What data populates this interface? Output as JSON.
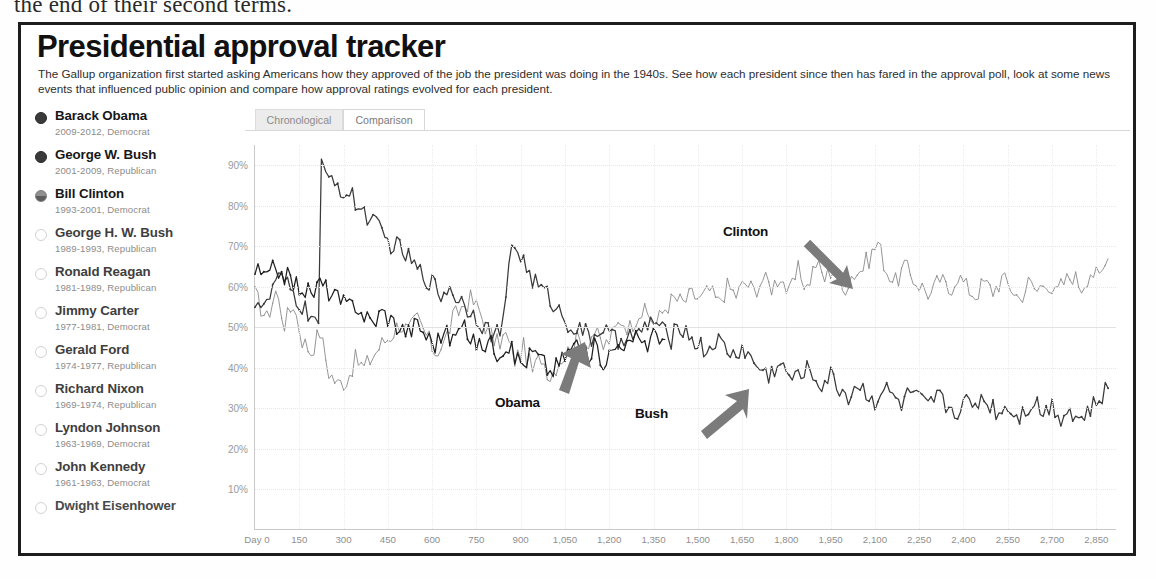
{
  "document_text": "the end of their second terms.",
  "header": {
    "title": "Presidential approval tracker",
    "subtitle": "The Gallup organization first started asking Americans how they approved of the job the president was doing in the 1940s. See how each president since then has fared in the approval poll, look at some news events that influenced public opinion and compare how approval ratings evolved for each president."
  },
  "tabs": [
    {
      "label": "Chronological",
      "active": false
    },
    {
      "label": "Comparison",
      "active": true
    }
  ],
  "sidebar": {
    "presidents": [
      {
        "name": "Barack Obama",
        "meta": "2009-2012, Democrat",
        "state": "on"
      },
      {
        "name": "George W. Bush",
        "meta": "2001-2009, Republican",
        "state": "on"
      },
      {
        "name": "Bill Clinton",
        "meta": "1993-2001, Democrat",
        "state": "half"
      },
      {
        "name": "George H. W. Bush",
        "meta": "1989-1993, Republican",
        "state": "off"
      },
      {
        "name": "Ronald Reagan",
        "meta": "1981-1989, Republican",
        "state": "off"
      },
      {
        "name": "Jimmy Carter",
        "meta": "1977-1981, Democrat",
        "state": "off"
      },
      {
        "name": "Gerald Ford",
        "meta": "1974-1977, Republican",
        "state": "off"
      },
      {
        "name": "Richard Nixon",
        "meta": "1969-1974, Republican",
        "state": "off"
      },
      {
        "name": "Lyndon Johnson",
        "meta": "1963-1969, Democrat",
        "state": "off"
      },
      {
        "name": "John Kennedy",
        "meta": "1961-1963, Democrat",
        "state": "off"
      },
      {
        "name": "Dwight Eisenhower",
        "meta": "",
        "state": "off"
      }
    ]
  },
  "annotations": [
    {
      "label": "Clinton",
      "arrow": "down-right"
    },
    {
      "label": "Obama",
      "arrow": "up-right"
    },
    {
      "label": "Bush",
      "arrow": "up-right"
    }
  ],
  "chart_data": {
    "type": "line",
    "title": "Presidential approval tracker",
    "xlabel": "Day 0",
    "ylabel": "",
    "xlim": [
      0,
      2920
    ],
    "ylim": [
      0,
      95
    ],
    "grid": true,
    "legend_position": "annotations-on-plot",
    "y_ticks": [
      "10%",
      "20%",
      "30%",
      "40%",
      "50%",
      "60%",
      "70%",
      "80%",
      "90%"
    ],
    "y_tick_values": [
      10,
      20,
      30,
      40,
      50,
      60,
      70,
      80,
      90
    ],
    "x_ticks": [
      "Day 0",
      "150",
      "300",
      "450",
      "600",
      "750",
      "900",
      "1,050",
      "1,200",
      "1,350",
      "1,500",
      "1,650",
      "1,800",
      "1,950",
      "2,100",
      "2,250",
      "2,400",
      "2,550",
      "2,700",
      "2,850"
    ],
    "x_tick_values": [
      0,
      150,
      300,
      450,
      600,
      750,
      900,
      1050,
      1200,
      1350,
      1500,
      1650,
      1800,
      1950,
      2100,
      2250,
      2400,
      2550,
      2700,
      2850
    ],
    "series": [
      {
        "name": "Bill Clinton",
        "color": "#8a8a8a",
        "x": [
          0,
          40,
          70,
          100,
          130,
          160,
          190,
          220,
          250,
          280,
          310,
          340,
          370,
          400,
          430,
          460,
          490,
          520,
          550,
          580,
          610,
          640,
          670,
          700,
          730,
          760,
          790,
          820,
          850,
          880,
          910,
          940,
          970,
          1000,
          1030,
          1060,
          1090,
          1120,
          1150,
          1180,
          1210,
          1240,
          1270,
          1300,
          1330,
          1360,
          1390,
          1420,
          1450,
          1480,
          1510,
          1540,
          1570,
          1600,
          1630,
          1660,
          1690,
          1720,
          1750,
          1780,
          1810,
          1840,
          1870,
          1900,
          1930,
          1960,
          1990,
          2020,
          2050,
          2080,
          2110,
          2140,
          2170,
          2200,
          2230,
          2260,
          2290,
          2320,
          2350,
          2380,
          2410,
          2440,
          2470,
          2500,
          2530,
          2560,
          2590,
          2620,
          2650,
          2680,
          2710,
          2740,
          2770,
          2800,
          2830,
          2860,
          2890
        ],
        "values": [
          58,
          52,
          59,
          51,
          56,
          47,
          44,
          49,
          39,
          36,
          37,
          42,
          40,
          43,
          46,
          48,
          51,
          49,
          52,
          48,
          44,
          46,
          52,
          55,
          57,
          54,
          49,
          46,
          48,
          42,
          45,
          39,
          43,
          38,
          42,
          44,
          47,
          46,
          49,
          45,
          48,
          52,
          50,
          54,
          53,
          51,
          55,
          57,
          56,
          58,
          57,
          59,
          56,
          60,
          58,
          61,
          59,
          62,
          60,
          63,
          58,
          64,
          60,
          66,
          62,
          65,
          59,
          63,
          64,
          67,
          71,
          64,
          61,
          65,
          62,
          60,
          58,
          62,
          59,
          63,
          60,
          58,
          61,
          59,
          62,
          60,
          57,
          61,
          59,
          62,
          58,
          61,
          63,
          60,
          64,
          62,
          67
        ]
      },
      {
        "name": "George W. Bush",
        "color": "#3a3a3a",
        "x": [
          0,
          40,
          70,
          100,
          130,
          160,
          190,
          215,
          225,
          240,
          270,
          300,
          330,
          360,
          390,
          420,
          450,
          480,
          510,
          540,
          570,
          600,
          630,
          660,
          690,
          720,
          750,
          780,
          810,
          840,
          870,
          900,
          930,
          960,
          990,
          1020,
          1050,
          1080,
          1110,
          1140,
          1170,
          1200,
          1230,
          1260,
          1290,
          1320,
          1350,
          1380,
          1410,
          1440,
          1470,
          1500,
          1530,
          1560,
          1590,
          1620,
          1650,
          1680,
          1710,
          1740,
          1770,
          1800,
          1830,
          1860,
          1890,
          1920,
          1950,
          1980,
          2010,
          2040,
          2070,
          2100,
          2130,
          2160,
          2190,
          2220,
          2250,
          2280,
          2310,
          2340,
          2370,
          2400,
          2430,
          2460,
          2490,
          2520,
          2550,
          2580,
          2610,
          2640,
          2670,
          2700,
          2730,
          2760,
          2790,
          2820,
          2850,
          2890
        ],
        "values": [
          57,
          55,
          62,
          61,
          58,
          55,
          53,
          51,
          90,
          86,
          87,
          83,
          82,
          79,
          77,
          74,
          71,
          70,
          68,
          65,
          63,
          61,
          58,
          60,
          57,
          55,
          53,
          50,
          48,
          50,
          71,
          68,
          63,
          60,
          58,
          55,
          52,
          50,
          49,
          47,
          50,
          48,
          46,
          49,
          47,
          50,
          52,
          49,
          47,
          51,
          48,
          46,
          44,
          47,
          45,
          43,
          45,
          42,
          40,
          38,
          41,
          39,
          37,
          40,
          38,
          36,
          38,
          35,
          33,
          36,
          34,
          32,
          35,
          33,
          31,
          34,
          32,
          30,
          33,
          31,
          29,
          32,
          30,
          33,
          31,
          29,
          31,
          28,
          30,
          32,
          29,
          31,
          28,
          30,
          27,
          29,
          31,
          35
        ]
      },
      {
        "name": "Barack Obama",
        "color": "#1f1f1f",
        "x": [
          0,
          40,
          70,
          100,
          130,
          160,
          190,
          220,
          250,
          280,
          310,
          340,
          370,
          400,
          430,
          460,
          490,
          520,
          550,
          580,
          610,
          640,
          670,
          700,
          730,
          760,
          790,
          820,
          850,
          880,
          910,
          940,
          970,
          1000,
          1030,
          1060,
          1090,
          1120,
          1150,
          1180,
          1210,
          1240,
          1270,
          1300,
          1330,
          1360,
          1390
        ],
        "values": [
          64,
          62,
          65,
          63,
          61,
          60,
          58,
          61,
          59,
          57,
          55,
          56,
          53,
          51,
          54,
          52,
          50,
          49,
          51,
          48,
          46,
          49,
          47,
          50,
          48,
          45,
          47,
          44,
          46,
          43,
          41,
          44,
          42,
          39,
          41,
          44,
          46,
          43,
          45,
          42,
          44,
          47,
          45,
          48,
          46,
          49,
          47
        ]
      }
    ]
  }
}
